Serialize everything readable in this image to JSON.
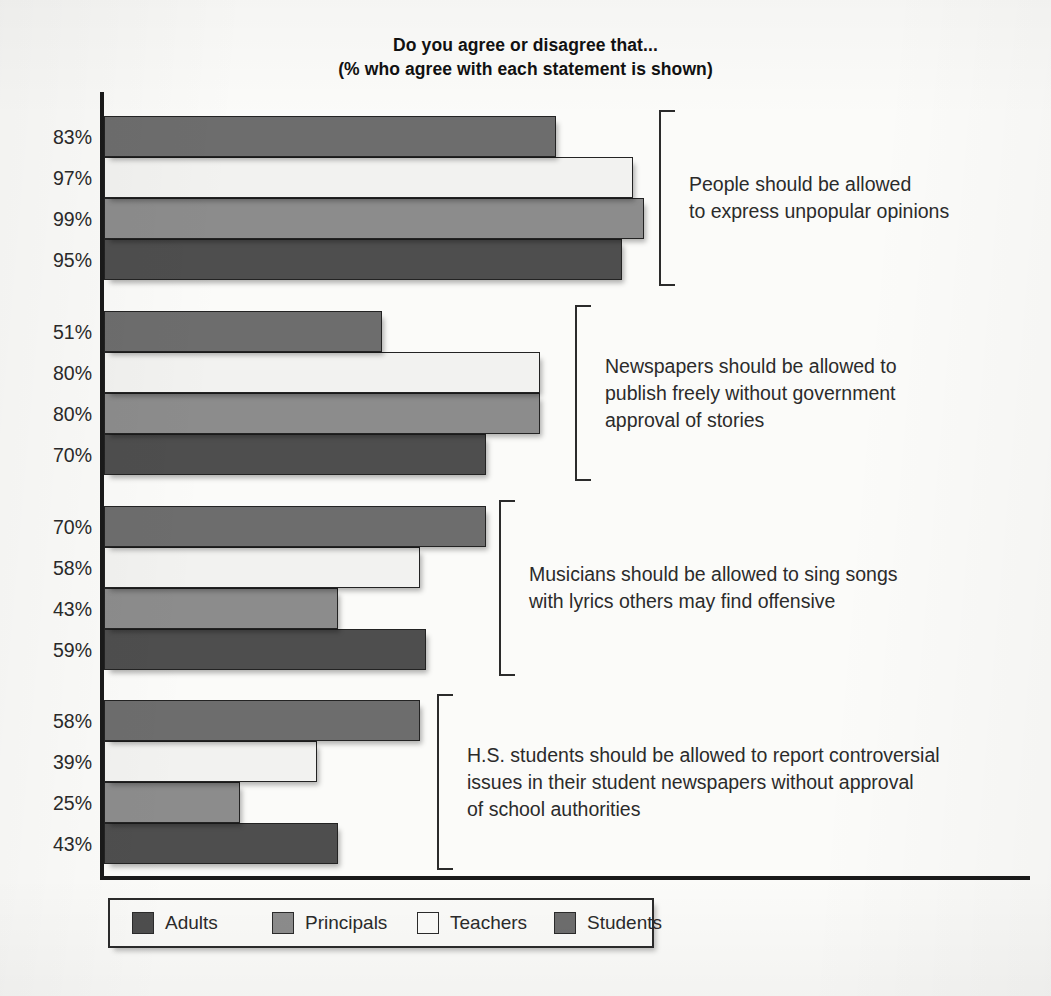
{
  "title": {
    "line1": "Do you agree or disagree that...",
    "line2": "(% who agree with each statement is shown)"
  },
  "legend": {
    "items": [
      {
        "label": "Adults",
        "key": "adults",
        "color": "#4e4e4e"
      },
      {
        "label": "Principals",
        "key": "principals",
        "color": "#8c8c8c"
      },
      {
        "label": "Teachers",
        "key": "teachers",
        "color": "#f2f2f0"
      },
      {
        "label": "Students",
        "key": "students",
        "color": "#6d6d6d"
      }
    ]
  },
  "groups": [
    {
      "statement_lines": [
        "People should be allowed",
        "to express unpopular opinions"
      ],
      "bars": [
        {
          "group": "Students",
          "value": 83,
          "label": "83%"
        },
        {
          "group": "Teachers",
          "value": 97,
          "label": "97%"
        },
        {
          "group": "Principals",
          "value": 99,
          "label": "99%"
        },
        {
          "group": "Adults",
          "value": 95,
          "label": "95%"
        }
      ]
    },
    {
      "statement_lines": [
        "Newspapers should be allowed to",
        "publish freely without government",
        "approval of stories"
      ],
      "bars": [
        {
          "group": "Students",
          "value": 51,
          "label": "51%"
        },
        {
          "group": "Teachers",
          "value": 80,
          "label": "80%"
        },
        {
          "group": "Principals",
          "value": 80,
          "label": "80%"
        },
        {
          "group": "Adults",
          "value": 70,
          "label": "70%"
        }
      ]
    },
    {
      "statement_lines": [
        "Musicians should be allowed to sing songs",
        "with lyrics others may find offensive"
      ],
      "bars": [
        {
          "group": "Students",
          "value": 70,
          "label": "70%"
        },
        {
          "group": "Teachers",
          "value": 58,
          "label": "58%"
        },
        {
          "group": "Principals",
          "value": 43,
          "label": "43%"
        },
        {
          "group": "Adults",
          "value": 59,
          "label": "59%"
        }
      ]
    },
    {
      "statement_lines": [
        "H.S. students should be allowed to report controversial",
        "issues in their student newspapers without approval",
        "of school authorities"
      ],
      "bars": [
        {
          "group": "Students",
          "value": 58,
          "label": "58%"
        },
        {
          "group": "Teachers",
          "value": 39,
          "label": "39%"
        },
        {
          "group": "Principals",
          "value": 25,
          "label": "25%"
        },
        {
          "group": "Adults",
          "value": 43,
          "label": "43%"
        }
      ]
    }
  ],
  "chart_data": {
    "type": "bar",
    "orientation": "horizontal",
    "title": "Do you agree or disagree that... (% who agree with each statement is shown)",
    "xlabel": "",
    "ylabel": "",
    "xlim": [
      0,
      100
    ],
    "grid": false,
    "legend_position": "bottom-left",
    "value_suffix": "%",
    "categories": [
      "People should be allowed to express unpopular opinions",
      "Newspapers should be allowed to publish freely without government approval of stories",
      "Musicians should be allowed to sing songs with lyrics others may find offensive",
      "H.S. students should be allowed to report controversial issues in their student newspapers without approval of school authorities"
    ],
    "series": [
      {
        "name": "Adults",
        "color": "#4e4e4e",
        "values": [
          95,
          70,
          59,
          43
        ]
      },
      {
        "name": "Principals",
        "color": "#8c8c8c",
        "values": [
          99,
          80,
          43,
          25
        ]
      },
      {
        "name": "Teachers",
        "color": "#f2f2f0",
        "values": [
          97,
          80,
          58,
          39
        ]
      },
      {
        "name": "Students",
        "color": "#6d6d6d",
        "values": [
          83,
          51,
          70,
          58
        ]
      }
    ],
    "bar_order_top_to_bottom_within_group": [
      "Students",
      "Teachers",
      "Principals",
      "Adults"
    ]
  }
}
